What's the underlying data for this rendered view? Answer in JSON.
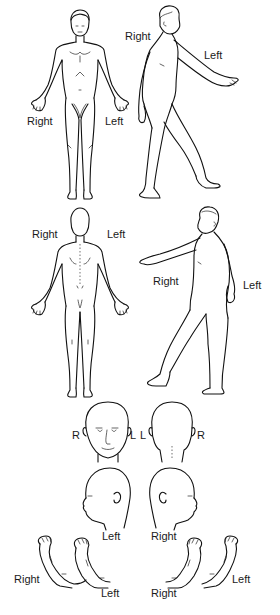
{
  "diagram": {
    "type": "anatomical-body-chart",
    "views": [
      {
        "id": "anterior",
        "labels": {
          "right": "Right",
          "left": "Left"
        }
      },
      {
        "id": "right-lateral-walking",
        "labels": {
          "right": "Right",
          "left": "Left"
        }
      },
      {
        "id": "posterior",
        "labels": {
          "right": "Right",
          "left": "Left"
        }
      },
      {
        "id": "left-lateral-walking",
        "labels": {
          "right": "Right",
          "left": "Left"
        }
      },
      {
        "id": "head-front",
        "labels": {
          "right": "R",
          "left": "L"
        }
      },
      {
        "id": "head-back",
        "labels": {
          "left": "L",
          "right": "R"
        }
      },
      {
        "id": "head-left-profile",
        "labels": {
          "side": "Left"
        }
      },
      {
        "id": "head-right-profile",
        "labels": {
          "side": "Right"
        }
      },
      {
        "id": "feet-soles-left-pair",
        "labels": {
          "right": "Right",
          "left": "Left"
        }
      },
      {
        "id": "feet-soles-right-pair",
        "labels": {
          "right": "Right",
          "left": "Left"
        }
      }
    ]
  }
}
